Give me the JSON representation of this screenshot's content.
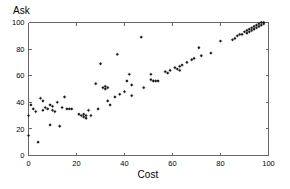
{
  "figure": {
    "background_color": "#ffffff",
    "foreground_color": "#000000",
    "axis_color": "#666666",
    "marker_color": "#1a1a1a"
  },
  "labels": {
    "ylabel": "Ask",
    "xlabel": "Cost"
  },
  "chart_data": {
    "type": "scatter",
    "title": "",
    "xlabel": "Cost",
    "ylabel": "Ask",
    "xlim": [
      0,
      100
    ],
    "ylim": [
      0,
      100
    ],
    "xticks": [
      0,
      20,
      40,
      60,
      80,
      100
    ],
    "yticks": [
      0,
      20,
      40,
      60,
      80,
      100
    ],
    "xtick_labels": [
      "0",
      "20",
      "40",
      "60",
      "80",
      "100"
    ],
    "ytick_labels": [
      "0",
      "20",
      "40",
      "60",
      "80",
      "100"
    ],
    "grid": false,
    "legend": null,
    "marker": "star",
    "marker_size": 2.0,
    "series": [
      {
        "name": "Ask vs Cost",
        "points": [
          [
            0,
            30
          ],
          [
            0,
            15
          ],
          [
            1,
            38
          ],
          [
            2,
            35
          ],
          [
            3,
            33
          ],
          [
            4,
            10
          ],
          [
            5,
            43
          ],
          [
            6,
            41
          ],
          [
            6,
            34
          ],
          [
            7,
            36
          ],
          [
            8,
            35
          ],
          [
            9,
            23
          ],
          [
            9,
            38
          ],
          [
            10,
            34
          ],
          [
            10,
            37
          ],
          [
            11,
            33
          ],
          [
            12,
            40
          ],
          [
            13,
            22
          ],
          [
            14,
            36
          ],
          [
            15,
            44
          ],
          [
            16,
            35
          ],
          [
            17,
            35
          ],
          [
            18,
            35
          ],
          [
            21,
            31
          ],
          [
            22,
            30
          ],
          [
            23,
            31
          ],
          [
            23,
            29
          ],
          [
            24,
            30
          ],
          [
            24,
            28
          ],
          [
            25,
            34
          ],
          [
            26,
            30
          ],
          [
            28,
            54
          ],
          [
            29,
            35
          ],
          [
            30,
            69
          ],
          [
            31,
            51
          ],
          [
            32,
            52
          ],
          [
            32,
            50
          ],
          [
            33,
            41
          ],
          [
            33,
            51
          ],
          [
            34,
            38
          ],
          [
            36,
            44
          ],
          [
            37,
            76
          ],
          [
            38,
            46
          ],
          [
            40,
            48
          ],
          [
            41,
            56
          ],
          [
            42,
            61
          ],
          [
            43,
            53
          ],
          [
            43,
            45
          ],
          [
            47,
            89
          ],
          [
            48,
            51
          ],
          [
            51,
            61
          ],
          [
            51,
            57
          ],
          [
            52,
            56
          ],
          [
            53,
            56
          ],
          [
            54,
            56
          ],
          [
            57,
            63
          ],
          [
            58,
            62
          ],
          [
            59,
            64
          ],
          [
            61,
            66
          ],
          [
            62,
            65
          ],
          [
            63,
            67
          ],
          [
            63,
            64
          ],
          [
            64,
            68
          ],
          [
            66,
            70
          ],
          [
            68,
            72
          ],
          [
            69,
            73
          ],
          [
            71,
            81
          ],
          [
            72,
            75
          ],
          [
            76,
            77
          ],
          [
            80,
            86
          ],
          [
            85,
            87
          ],
          [
            86,
            88
          ],
          [
            87,
            90
          ],
          [
            88,
            91
          ],
          [
            89,
            91
          ],
          [
            90,
            93
          ],
          [
            91,
            92
          ],
          [
            91,
            94
          ],
          [
            92,
            93
          ],
          [
            92,
            95
          ],
          [
            93,
            94
          ],
          [
            93,
            96
          ],
          [
            94,
            95
          ],
          [
            94,
            97
          ],
          [
            95,
            96
          ],
          [
            95,
            98
          ],
          [
            96,
            97
          ],
          [
            96,
            99
          ],
          [
            97,
            98
          ],
          [
            97,
            100
          ],
          [
            98,
            99
          ],
          [
            98,
            100
          ]
        ]
      }
    ]
  }
}
